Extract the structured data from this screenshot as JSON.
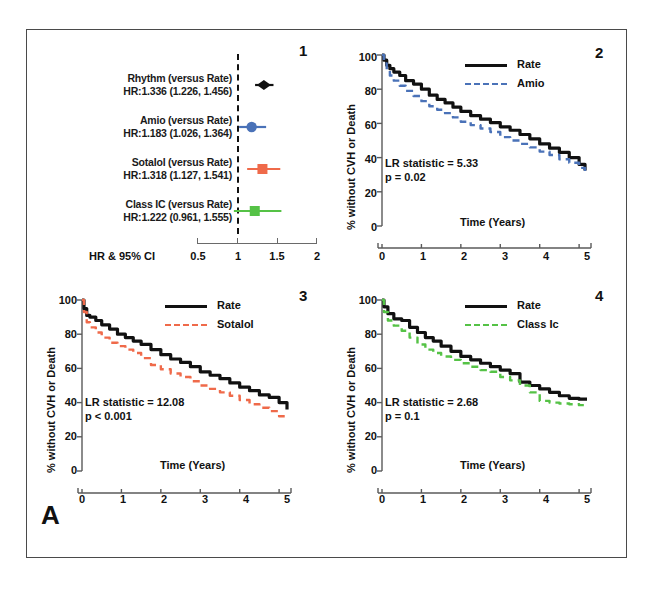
{
  "figure": {
    "panel_label": "A",
    "background": "#ffffff",
    "border_color": "#4a4a4a"
  },
  "colors": {
    "rate_black": "#111111",
    "amio_blue": "#4a72b8",
    "sotalol_orange": "#ef6a4a",
    "classic_green": "#55c246",
    "axis_gray": "#5a5a5a"
  },
  "chart_data": [
    {
      "type": "forest",
      "panel_number": "1",
      "title": "",
      "xlabel": "HR & 95% CI",
      "xlim": [
        0.5,
        2.0
      ],
      "xticks": [
        "0.5",
        "1",
        "1.5",
        "2"
      ],
      "xtick_values": [
        0.5,
        1,
        1.5,
        2
      ],
      "null_line": 1,
      "grid": false,
      "rows": [
        {
          "label": "Rhythm (versus Rate)",
          "estimate_text": "HR:1.336 (1.226, 1.456)",
          "hr": 1.336,
          "ci_low": 1.226,
          "ci_high": 1.456,
          "color": "#111111",
          "marker": "diamond"
        },
        {
          "label": "Amio (versus Rate)",
          "estimate_text": "HR:1.183 (1.026, 1.364)",
          "hr": 1.183,
          "ci_low": 1.026,
          "ci_high": 1.364,
          "color": "#4a72b8",
          "marker": "circle"
        },
        {
          "label": "Sotalol (versus Rate)",
          "estimate_text": "HR:1.318 (1.127, 1.541)",
          "hr": 1.318,
          "ci_low": 1.127,
          "ci_high": 1.541,
          "color": "#ef6a4a",
          "marker": "square"
        },
        {
          "label": "Class IC (versus Rate)",
          "estimate_text": "HR:1.222 (0.961, 1.555)",
          "hr": 1.222,
          "ci_low": 0.961,
          "ci_high": 1.555,
          "color": "#55c246",
          "marker": "square"
        }
      ]
    },
    {
      "type": "line",
      "panel_number": "2",
      "ylabel": "% without CVH or Death",
      "xlabel": "Time (Years)",
      "xlim": [
        0,
        5.2
      ],
      "ylim": [
        0,
        100
      ],
      "xticks": [
        "0",
        "1",
        "2",
        "3",
        "4",
        "5"
      ],
      "yticks": [
        "0",
        "20",
        "40",
        "60",
        "80",
        "100"
      ],
      "grid": false,
      "legend_position": "top-right",
      "annotations": [
        "LR statistic = 5.33",
        "p = 0.02"
      ],
      "series": [
        {
          "name": "Rate",
          "color": "#111111",
          "style": "solid",
          "x": [
            0,
            0.05,
            0.12,
            0.2,
            0.3,
            0.45,
            0.6,
            0.8,
            1.0,
            1.2,
            1.4,
            1.6,
            1.8,
            2.0,
            2.25,
            2.5,
            2.75,
            3.0,
            3.25,
            3.5,
            3.75,
            4.0,
            4.25,
            4.5,
            4.75,
            5.0,
            5.15
          ],
          "y": [
            100,
            97,
            94,
            92,
            90,
            88,
            85,
            83,
            80,
            76.5,
            74,
            72,
            69.5,
            67,
            64.5,
            62.5,
            60.5,
            58,
            56,
            53.5,
            51,
            48,
            45.5,
            43,
            40,
            36,
            32.5
          ]
        },
        {
          "name": "Amio",
          "color": "#4a72b8",
          "style": "dashed",
          "x": [
            0,
            0.05,
            0.12,
            0.2,
            0.3,
            0.45,
            0.6,
            0.8,
            1.0,
            1.2,
            1.4,
            1.6,
            1.8,
            2.0,
            2.25,
            2.5,
            2.75,
            3.0,
            3.25,
            3.5,
            3.75,
            4.0,
            4.25,
            4.5,
            4.75,
            5.0,
            5.15
          ],
          "y": [
            100,
            95,
            91,
            88,
            85,
            82,
            79,
            76,
            73,
            70,
            68,
            66,
            63.5,
            61,
            59,
            57,
            55,
            52,
            50,
            48,
            46,
            43.5,
            41.5,
            39,
            37,
            34,
            31.5
          ]
        }
      ]
    },
    {
      "type": "line",
      "panel_number": "3",
      "ylabel": "% without CVH or Death",
      "xlabel": "Time (Years)",
      "xlim": [
        0,
        5.2
      ],
      "ylim": [
        0,
        100
      ],
      "xticks": [
        "0",
        "1",
        "2",
        "3",
        "4",
        "5"
      ],
      "yticks": [
        "0",
        "20",
        "40",
        "60",
        "80",
        "100"
      ],
      "grid": false,
      "legend_position": "top-right",
      "annotations": [
        "LR statistic = 12.08",
        "p < 0.001"
      ],
      "series": [
        {
          "name": "Rate",
          "color": "#111111",
          "style": "solid",
          "x": [
            0,
            0.05,
            0.12,
            0.2,
            0.35,
            0.5,
            0.7,
            0.9,
            1.1,
            1.3,
            1.5,
            1.75,
            2.0,
            2.25,
            2.5,
            2.75,
            3.0,
            3.25,
            3.5,
            3.75,
            4.0,
            4.25,
            4.5,
            4.75,
            5.0,
            5.2
          ],
          "y": [
            100,
            95,
            91,
            90,
            88,
            85.5,
            83,
            80,
            78,
            76,
            74,
            71,
            68,
            65.5,
            63.5,
            61,
            58,
            56,
            54,
            51.5,
            49,
            47,
            44.5,
            43,
            40,
            36
          ]
        },
        {
          "name": "Sotalol",
          "color": "#ef6a4a",
          "style": "dashed",
          "x": [
            0,
            0.05,
            0.12,
            0.2,
            0.35,
            0.5,
            0.7,
            0.9,
            1.1,
            1.3,
            1.5,
            1.75,
            2.0,
            2.25,
            2.5,
            2.75,
            3.0,
            3.25,
            3.5,
            3.75,
            4.0,
            4.25,
            4.5,
            4.75,
            5.0,
            5.2
          ],
          "y": [
            100,
            93,
            87,
            84,
            81,
            78,
            75,
            73,
            71,
            69,
            66,
            62,
            59.5,
            57,
            55,
            52.5,
            50,
            48,
            46,
            44,
            41.5,
            39,
            37,
            35,
            32,
            31.5
          ]
        }
      ]
    },
    {
      "type": "line",
      "panel_number": "4",
      "ylabel": "% without CVH or Death",
      "xlabel": "Time (Years)",
      "xlim": [
        0,
        5.2
      ],
      "ylim": [
        0,
        100
      ],
      "xticks": [
        "0",
        "1",
        "2",
        "3",
        "4",
        "5"
      ],
      "yticks": [
        "0",
        "20",
        "40",
        "60",
        "80",
        "100"
      ],
      "grid": false,
      "legend_position": "top-right",
      "annotations": [
        "LR statistic = 2.68",
        "p = 0.1"
      ],
      "series": [
        {
          "name": "Rate",
          "color": "#111111",
          "style": "solid",
          "x": [
            0,
            0.05,
            0.15,
            0.3,
            0.5,
            0.7,
            0.9,
            1.1,
            1.3,
            1.5,
            1.75,
            2.0,
            2.25,
            2.5,
            2.75,
            3.0,
            3.25,
            3.5,
            3.75,
            4.0,
            4.25,
            4.5,
            4.75,
            5.0,
            5.2
          ],
          "y": [
            100,
            96,
            92,
            89,
            88,
            84,
            81,
            78,
            76,
            73,
            70,
            67,
            65,
            63,
            61,
            59,
            57,
            52,
            50,
            48,
            46,
            44,
            42.5,
            42,
            42
          ]
        },
        {
          "name": "Class Ic",
          "color": "#55c246",
          "style": "dashed",
          "x": [
            0,
            0.05,
            0.15,
            0.3,
            0.5,
            0.7,
            0.9,
            1.1,
            1.3,
            1.5,
            1.75,
            2.0,
            2.25,
            2.5,
            2.75,
            3.0,
            3.25,
            3.5,
            3.75,
            4.0,
            4.25,
            4.5,
            4.75,
            5.0,
            5.2
          ],
          "y": [
            100,
            93,
            88,
            85,
            82,
            78,
            74,
            71,
            69,
            67,
            65,
            63,
            61,
            59,
            58,
            55,
            53,
            50,
            46,
            41,
            40,
            39.5,
            39,
            38.5,
            38.5
          ]
        }
      ]
    }
  ]
}
